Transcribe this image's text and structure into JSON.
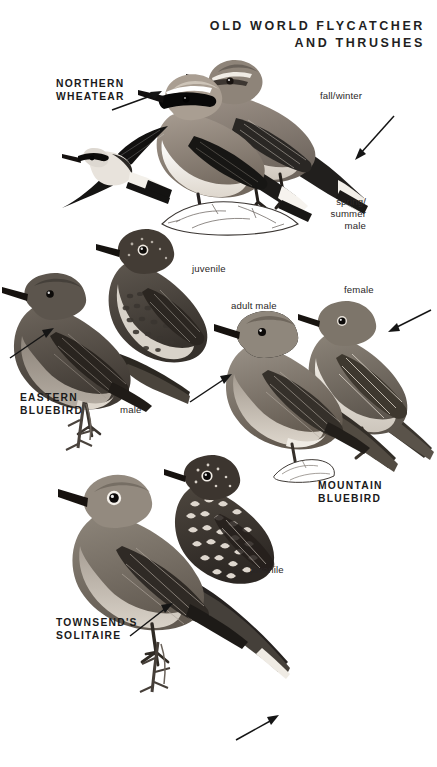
{
  "plate": {
    "title": "OLD WORLD FLYCATCHER\nAND THRUSHES",
    "background_color": "#ffffff",
    "text_color": "#1b1b1b"
  },
  "species": [
    {
      "id": "northern-wheatear",
      "name": "NORTHERN\nWHEATEAR",
      "annotations": [
        "fall/winter",
        "spring/\nsummer\nmale"
      ]
    },
    {
      "id": "eastern-bluebird",
      "name": "EASTERN\nBLUEBIRD",
      "annotations": [
        "juvenile",
        "male"
      ]
    },
    {
      "id": "mountain-bluebird",
      "name": "MOUNTAIN\nBLUEBIRD",
      "annotations": [
        "adult male",
        "female"
      ]
    },
    {
      "id": "townsends-solitaire",
      "name": "TOWNSEND'S\nSOLITAIRE",
      "annotations": [
        "juvenile"
      ]
    }
  ],
  "labels": {
    "fall_winter": "fall/winter",
    "spring_summer_male": "spring/\nsummer\nmale",
    "juvenile_eastern": "juvenile",
    "male_eastern": "male",
    "adult_male": "adult male",
    "female": "female",
    "juvenile_solitaire": "juvenile"
  },
  "figures": [
    {
      "id": "wheatear-flight",
      "caption_ref": "northern-wheatear"
    },
    {
      "id": "wheatear-spring-male",
      "caption_ref": "spring_summer_male"
    },
    {
      "id": "wheatear-fall-winter",
      "caption_ref": "fall_winter"
    },
    {
      "id": "eastern-bluebird-male",
      "caption_ref": "male_eastern"
    },
    {
      "id": "eastern-bluebird-juv",
      "caption_ref": "juvenile_eastern"
    },
    {
      "id": "mountain-bluebird-male",
      "caption_ref": "adult_male"
    },
    {
      "id": "mountain-bluebird-female",
      "caption_ref": "female"
    },
    {
      "id": "solitaire-adult",
      "caption_ref": "townsends-solitaire"
    },
    {
      "id": "solitaire-juv",
      "caption_ref": "juvenile_solitaire"
    }
  ],
  "pointers": [
    {
      "id": "pointer-wheatear-face",
      "target": "wheatear face mask"
    },
    {
      "id": "pointer-fall-winter-tail",
      "target": "fall/winter tail pattern"
    },
    {
      "id": "pointer-eastern-breast",
      "target": "eastern bluebird breast"
    },
    {
      "id": "pointer-mountain-male",
      "target": "mountain bluebird male breast"
    },
    {
      "id": "pointer-mountain-female",
      "target": "mountain bluebird female head"
    },
    {
      "id": "pointer-solitaire-wing",
      "target": "solitaire wing patch"
    },
    {
      "id": "pointer-solitaire-tail",
      "target": "solitaire outer tail feathers"
    }
  ]
}
